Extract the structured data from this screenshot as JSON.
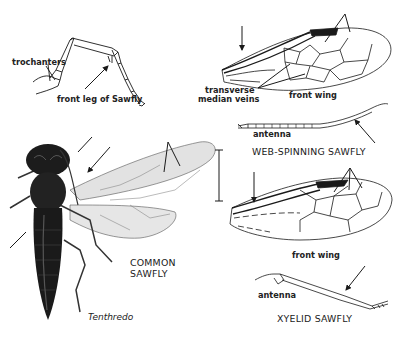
{
  "figure": {
    "palette": {
      "ink": "#1a1a1a",
      "body_dark": "#1c1c1c",
      "wing_shade": "#dcdcdc",
      "paper": "#ffffff"
    }
  },
  "labels": {
    "trochanters": "trochanters",
    "front_leg": "front leg of Sawfly",
    "transverse_1": "transverse",
    "transverse_2": "median veins",
    "front_wing_top": "front wing",
    "antenna_top": "antenna",
    "web_spinning": "WEB-SPINNING SAWFLY",
    "common_1": "COMMON",
    "common_2": "SAWFLY",
    "genus": "Tenthredo",
    "front_wing_bottom": "front wing",
    "antenna_bottom": "antenna",
    "xyelid": "XYELID SAWFLY"
  },
  "panels": [
    {
      "id": "front-leg",
      "caption": "front leg of Sawfly",
      "callouts": [
        "trochanters"
      ]
    },
    {
      "id": "web-spinning-sawfly",
      "caption": "WEB-SPINNING SAWFLY",
      "parts": [
        "front wing",
        "antenna"
      ],
      "callouts": [
        "transverse median veins"
      ]
    },
    {
      "id": "common-sawfly",
      "caption": "COMMON SAWFLY",
      "genus": "Tenthredo"
    },
    {
      "id": "xyelid-sawfly",
      "caption": "XYELID SAWFLY",
      "parts": [
        "front wing",
        "antenna"
      ]
    }
  ]
}
